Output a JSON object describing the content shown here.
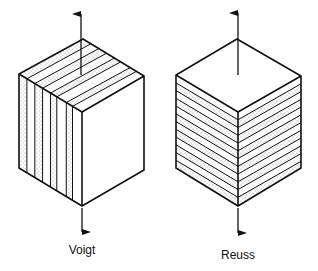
{
  "figure": {
    "models": [
      {
        "name": "Voigt",
        "layer_orientation": "vertical (parallel to load)",
        "load_arrows": [
          "up",
          "down"
        ]
      },
      {
        "name": "Reuss",
        "layer_orientation": "horizontal (perpendicular to load)",
        "load_arrows": [
          "up",
          "down"
        ]
      }
    ],
    "colors": {
      "line": "#111111",
      "background": "#ffffff",
      "stipple": "#333333"
    }
  }
}
